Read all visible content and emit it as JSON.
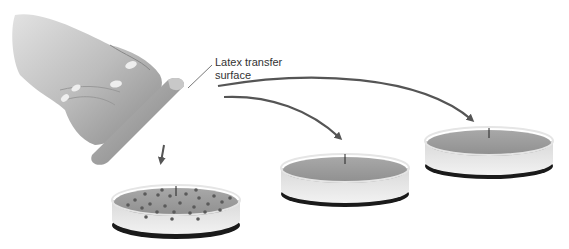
{
  "figure": {
    "callout": {
      "line1": "Latex transfer",
      "line2": "surface"
    },
    "elements": {
      "hand": "hand holding latex transfer block",
      "plates": [
        {
          "id": "master-plate",
          "description": "petri dish with colonies"
        },
        {
          "id": "replica-plate-1",
          "description": "petri dish, uniform agar"
        },
        {
          "id": "replica-plate-2",
          "description": "petri dish, uniform agar"
        }
      ],
      "arrows": [
        "down to master plate",
        "to replica plate 1",
        "to replica plate 2"
      ]
    },
    "colors": {
      "arrow": "#5a5a5a",
      "agar": "#9e9e9e",
      "colony": "#5c5c5c",
      "dish_rim": "#e8e8e8",
      "dish_base": "#222222"
    }
  }
}
